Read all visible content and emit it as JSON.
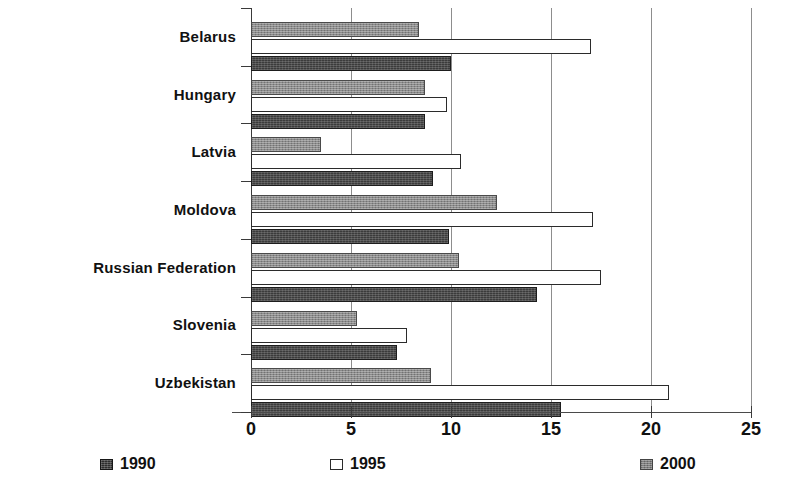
{
  "chart_data": {
    "type": "bar",
    "orientation": "horizontal",
    "title": "",
    "subtitle": "",
    "xlabel": "",
    "ylabel": "",
    "xlim": [
      0,
      25
    ],
    "xticks": [
      0,
      5,
      10,
      15,
      20,
      25
    ],
    "xtick_labels": [
      "0",
      "5",
      "10",
      "15",
      "20",
      "25"
    ],
    "grid": true,
    "grid_axis": "x",
    "legend_position": "bottom",
    "categories": [
      "Belarus",
      "Hungary",
      "Latvia",
      "Moldova",
      "Russian Federation",
      "Slovenia",
      "Uzbekistan"
    ],
    "series": [
      {
        "name": "1990",
        "color": "#3b3b3b",
        "values": [
          10.0,
          8.7,
          9.1,
          9.9,
          14.3,
          7.3,
          15.5
        ]
      },
      {
        "name": "1995",
        "color": "#ffffff",
        "values": [
          17.0,
          9.8,
          10.5,
          17.1,
          17.5,
          7.8,
          20.9
        ]
      },
      {
        "name": "2000",
        "color": "#8b8b8b",
        "values": [
          8.4,
          8.7,
          3.5,
          12.3,
          10.4,
          5.3,
          9.0
        ]
      }
    ],
    "series_draw_order_top_to_bottom": [
      "2000",
      "1995",
      "1990"
    ]
  },
  "legend": {
    "items": [
      {
        "label": "1990",
        "swatch": "dark-hatched-square"
      },
      {
        "label": "1995",
        "swatch": "white-outlined-square"
      },
      {
        "label": "2000",
        "swatch": "gray-hatched-square"
      }
    ]
  }
}
